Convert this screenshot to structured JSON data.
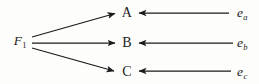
{
  "figure": {
    "type": "directed-graph",
    "background_color": "#fdfdfc",
    "ink_color": "#1a1a1a",
    "nodes": [
      {
        "id": "F1",
        "label_main": "F",
        "label_sub": "1",
        "style": "math",
        "x": 20,
        "y": 41
      },
      {
        "id": "A",
        "label_main": "A",
        "label_sub": "",
        "style": "plain",
        "x": 127,
        "y": 13
      },
      {
        "id": "B",
        "label_main": "B",
        "label_sub": "",
        "style": "plain",
        "x": 127,
        "y": 43
      },
      {
        "id": "C",
        "label_main": "C",
        "label_sub": "",
        "style": "plain",
        "x": 127,
        "y": 72
      },
      {
        "id": "ea",
        "label_main": "e",
        "label_sub": "a",
        "style": "math",
        "x": 242,
        "y": 13
      },
      {
        "id": "eb",
        "label_main": "e",
        "label_sub": "b",
        "style": "math",
        "x": 242,
        "y": 43
      },
      {
        "id": "ec",
        "label_main": "e",
        "label_sub": "c",
        "style": "math",
        "x": 242,
        "y": 72
      }
    ],
    "edges": [
      {
        "id": "F1-A",
        "from": "F1",
        "to": "A",
        "x1": 32,
        "y1": 37,
        "x2": 115,
        "y2": 13.5,
        "direction": "rightward"
      },
      {
        "id": "F1-B",
        "from": "F1",
        "to": "B",
        "x1": 32,
        "y1": 43,
        "x2": 115,
        "y2": 43,
        "direction": "rightward"
      },
      {
        "id": "F1-C",
        "from": "F1",
        "to": "C",
        "x1": 32,
        "y1": 48,
        "x2": 114,
        "y2": 71,
        "direction": "rightward"
      },
      {
        "id": "ea-A",
        "from": "ea",
        "to": "A",
        "x1": 229,
        "y1": 13,
        "x2": 139,
        "y2": 13,
        "direction": "leftward"
      },
      {
        "id": "eb-B",
        "from": "eb",
        "to": "B",
        "x1": 233,
        "y1": 43,
        "x2": 139,
        "y2": 43,
        "direction": "leftward"
      },
      {
        "id": "ec-C",
        "from": "ec",
        "to": "C",
        "x1": 231,
        "y1": 71,
        "x2": 139,
        "y2": 71,
        "direction": "leftward"
      }
    ]
  }
}
